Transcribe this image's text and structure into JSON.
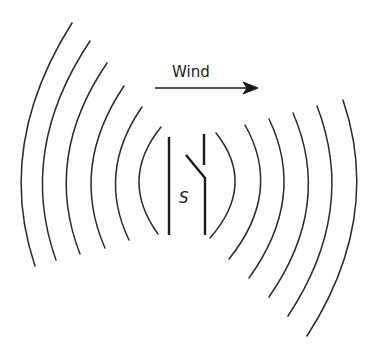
{
  "figure": {
    "wind_label": "Wind",
    "switch_label": "S",
    "colors": {
      "ink": "#1a1a1a",
      "background": "#ffffff"
    },
    "arrow": {
      "direction": "right",
      "x1": 155,
      "x2": 258,
      "y": 88
    },
    "wavefronts_left": [
      {
        "start": [
          72,
          23
        ],
        "control": [
          -5.5,
          145.5
        ],
        "end": [
          35,
          266
        ]
      },
      {
        "start": [
          90,
          41
        ],
        "control": [
          17,
          150.5
        ],
        "end": [
          56,
          260
        ]
      },
      {
        "start": [
          107,
          63
        ],
        "control": [
          42.5,
          157.5
        ],
        "end": [
          80,
          254
        ]
      },
      {
        "start": [
          124,
          86
        ],
        "control": [
          69.5,
          167
        ],
        "end": [
          105,
          248
        ]
      },
      {
        "start": [
          142,
          107
        ],
        "control": [
          96.5,
          172.5
        ],
        "end": [
          129,
          240
        ]
      },
      {
        "start": [
          161,
          127
        ],
        "control": [
          118.5,
          179.5
        ],
        "end": [
          158,
          234
        ]
      }
    ],
    "wavefronts_right": [
      {
        "start": [
          216,
          133
        ],
        "control": [
          257,
          184.5
        ],
        "end": [
          210,
          238
        ]
      },
      {
        "start": [
          245,
          125
        ],
        "control": [
          283,
          192
        ],
        "end": [
          229,
          259
        ]
      },
      {
        "start": [
          269,
          119
        ],
        "control": [
          307,
          197.5
        ],
        "end": [
          249,
          278
        ]
      },
      {
        "start": [
          293,
          113
        ],
        "control": [
          333,
          205
        ],
        "end": [
          269,
          297
        ]
      },
      {
        "start": [
          317,
          106
        ],
        "control": [
          357.5,
          211
        ],
        "end": [
          288,
          316
        ]
      },
      {
        "start": [
          343,
          100
        ],
        "control": [
          383,
          218
        ],
        "end": [
          307,
          336
        ]
      }
    ]
  }
}
